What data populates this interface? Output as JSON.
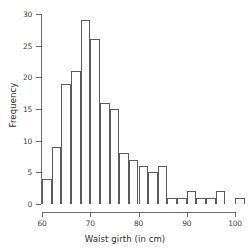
{
  "chart_data": {
    "type": "bar",
    "title": "",
    "subtitle": "",
    "xlabel": "Waist girth (in cm)",
    "ylabel": "Frequency",
    "xlim": [
      60,
      102
    ],
    "ylim": [
      0,
      30
    ],
    "grid": false,
    "legend": null,
    "bin_width": 2,
    "bin_edges": [
      60,
      62,
      64,
      66,
      68,
      70,
      72,
      74,
      76,
      78,
      80,
      82,
      84,
      86,
      88,
      90,
      92,
      94,
      96,
      98,
      100,
      102
    ],
    "categories": [
      "60-62",
      "62-64",
      "64-66",
      "66-68",
      "68-70",
      "70-72",
      "72-74",
      "74-76",
      "76-78",
      "78-80",
      "80-82",
      "82-84",
      "84-86",
      "86-88",
      "88-90",
      "90-92",
      "92-94",
      "94-96",
      "96-98",
      "98-100",
      "100-102"
    ],
    "values": [
      4,
      9,
      19,
      21,
      29,
      26,
      16,
      15,
      8,
      7,
      6,
      5,
      6,
      1,
      1,
      2,
      1,
      1,
      2,
      0,
      1
    ],
    "x_ticks": [
      60,
      70,
      80,
      90,
      100
    ],
    "x_tick_labels": [
      "60",
      "70",
      "80",
      "90",
      "100"
    ],
    "y_ticks": [
      0,
      5,
      10,
      15,
      20,
      25,
      30
    ],
    "y_tick_labels": [
      "0",
      "5",
      "10",
      "15",
      "20",
      "25",
      "30"
    ],
    "colors": {
      "bar_fill": "#ffffff",
      "bar_stroke": "#5a5a5a",
      "axis": "#6b6b6b",
      "text": "#2e2e2e",
      "background": "#ffffff"
    }
  }
}
